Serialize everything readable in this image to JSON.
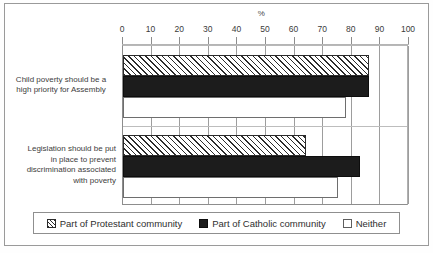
{
  "chart_data": {
    "type": "bar",
    "orientation": "horizontal",
    "title": "",
    "xlabel": "%",
    "ylabel": "",
    "xlim": [
      0,
      100
    ],
    "xticks": [
      0,
      10,
      20,
      30,
      40,
      50,
      60,
      70,
      80,
      90,
      100
    ],
    "xtick_labels": [
      "0",
      "10",
      "20",
      "30",
      "40",
      "50",
      "60",
      "70",
      "80",
      "90",
      "100"
    ],
    "grid": true,
    "legend_position": "bottom",
    "categories": [
      "Child poverty should be a high priority for Assembly",
      "Legislation should be put in place to  prevent discrimination associated with poverty"
    ],
    "category_lines": [
      [
        "Child poverty should be a",
        "high priority for Assembly"
      ],
      [
        "Legislation should be put",
        "in place to  prevent",
        "discrimination associated",
        "with poverty"
      ]
    ],
    "series": [
      {
        "name": "Part of Protestant community",
        "fill": "hatched-diagonal",
        "color": "#ffffff",
        "edge": "#2b2b2b",
        "values": [
          86,
          64
        ]
      },
      {
        "name": "Part of Catholic community",
        "fill": "solid",
        "color": "#1c1c1c",
        "edge": "#0d0d0d",
        "values": [
          86,
          83
        ]
      },
      {
        "name": "Neither",
        "fill": "empty",
        "color": "#ffffff",
        "edge": "#6e6e6e",
        "values": [
          78,
          75
        ]
      }
    ]
  },
  "legend": {
    "items": [
      {
        "label": "Part of Protestant community",
        "swatch": "hatch-swatch-icon"
      },
      {
        "label": "Part of Catholic community",
        "swatch": "filled-swatch-icon"
      },
      {
        "label": "Neither",
        "swatch": "empty-swatch-icon"
      }
    ]
  }
}
